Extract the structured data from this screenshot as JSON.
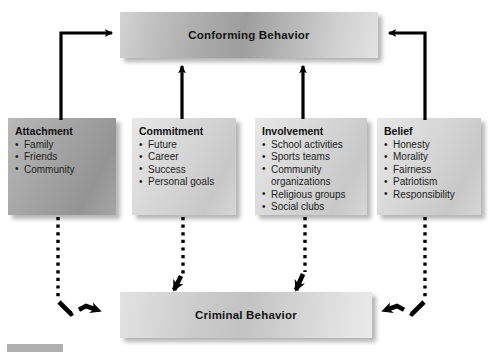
{
  "diagram": {
    "title_top": "Conforming Behavior",
    "title_bottom": "Criminal Behavior",
    "pillars": [
      {
        "heading": "Attachment",
        "items": [
          "Family",
          "Friends",
          "Community"
        ]
      },
      {
        "heading": "Commitment",
        "items": [
          "Future",
          "Career",
          "Success",
          "Personal goals"
        ]
      },
      {
        "heading": "Involvement",
        "items": [
          "School activities",
          "Sports teams",
          "Community\norganizations",
          "Religious groups",
          "Social clubs"
        ]
      },
      {
        "heading": "Belief",
        "items": [
          "Honesty",
          "Morality",
          "Fairness",
          "Patriotism",
          "Responsibility"
        ]
      }
    ],
    "arrows": {
      "solid_label": "leads-to-conforming-behavior",
      "dotted_label": "absence-leads-to-criminal-behavior"
    },
    "colors": {
      "arrow": "#000000",
      "box_dark": "#9f9f9f",
      "box_light": "#d8d8d8",
      "banner": "#a9a9a9",
      "marker": "#b0b0b0"
    }
  }
}
